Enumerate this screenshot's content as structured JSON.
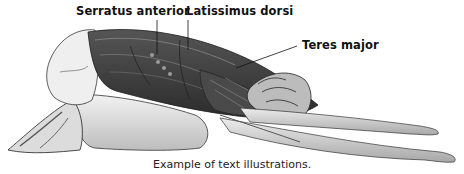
{
  "figure": {
    "labels": [
      {
        "id": "serratus",
        "text": "Serratus anterior"
      },
      {
        "id": "latissimus",
        "text": "Latissimus dorsi"
      },
      {
        "id": "teres",
        "text": "Teres major"
      }
    ],
    "caption": "Example of text illustrations.",
    "colors": {
      "muscle_dark": "#3a3a3a",
      "muscle_mid": "#6e6e6e",
      "skin_light": "#e8e8e8",
      "skin_shadow": "#b5b5b5",
      "outline": "#222222",
      "label_text": "#111111"
    }
  }
}
